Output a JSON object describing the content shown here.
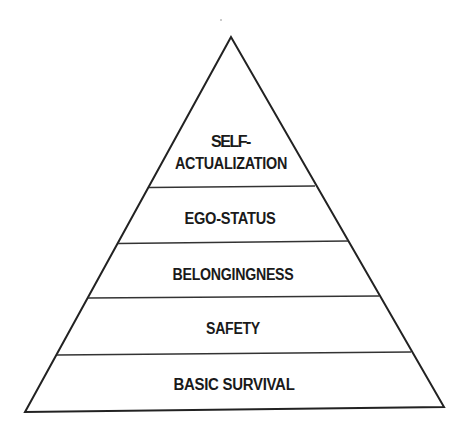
{
  "diagram": {
    "type": "pyramid",
    "stroke_color": "#222222",
    "fill_color": "#ffffff",
    "text_color": "#1a1a1a",
    "levels": [
      {
        "label_lines": [
          "SELF-",
          "ACTUALIZATION"
        ],
        "position": "top"
      },
      {
        "label_lines": [
          "EGO-STATUS"
        ],
        "position": "second"
      },
      {
        "label_lines": [
          "BELONGINGNESS"
        ],
        "position": "middle"
      },
      {
        "label_lines": [
          "SAFETY"
        ],
        "position": "fourth"
      },
      {
        "label_lines": [
          "BASIC SURVIVAL"
        ],
        "position": "base"
      }
    ]
  }
}
